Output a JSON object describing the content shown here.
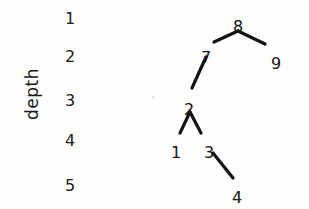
{
  "figure": {
    "background_color": "#fdfdfc",
    "ink_color": "#141414",
    "width": 309,
    "height": 209
  },
  "axis": {
    "label": "depth",
    "orientation": "vertical-rotated",
    "ticks": [
      {
        "text": "1",
        "x": 60,
        "y": 9
      },
      {
        "text": "2",
        "x": 60,
        "y": 47
      },
      {
        "text": "3",
        "x": 60,
        "y": 91
      },
      {
        "text": "4",
        "x": 60,
        "y": 131
      },
      {
        "text": "5",
        "x": 60,
        "y": 176
      }
    ]
  },
  "chart_data": {
    "type": "diagram",
    "title": "",
    "xlabel": "",
    "ylabel": "depth",
    "ylim": [
      1,
      5
    ],
    "grid": false,
    "legend": null,
    "nodes": [
      {
        "id": "8",
        "label": "8",
        "depth": 1,
        "x": 238,
        "y": 17
      },
      {
        "id": "7",
        "label": "7",
        "depth": 2,
        "x": 206,
        "y": 48
      },
      {
        "id": "9",
        "label": "9",
        "depth": 2,
        "x": 276,
        "y": 54
      },
      {
        "id": "2",
        "label": "2",
        "depth": 3,
        "x": 189,
        "y": 100
      },
      {
        "id": "1",
        "label": "1",
        "depth": 4,
        "x": 176,
        "y": 143
      },
      {
        "id": "3",
        "label": "3",
        "depth": 4,
        "x": 209,
        "y": 143
      },
      {
        "id": "4",
        "label": "4",
        "depth": 5,
        "x": 237,
        "y": 188
      }
    ],
    "edges": [
      {
        "from": "8",
        "to": "7",
        "x1": 238,
        "y1": 31,
        "x2": 214,
        "y2": 42
      },
      {
        "from": "8",
        "to": "9",
        "x1": 238,
        "y1": 31,
        "x2": 265,
        "y2": 44
      },
      {
        "from": "7",
        "to": "2",
        "x1": 206,
        "y1": 57,
        "x2": 192,
        "y2": 88
      },
      {
        "from": "2",
        "to": "1",
        "x1": 190,
        "y1": 112,
        "x2": 180,
        "y2": 133
      },
      {
        "from": "2",
        "to": "3",
        "x1": 190,
        "y1": 112,
        "x2": 201,
        "y2": 133
      },
      {
        "from": "3",
        "to": "4",
        "x1": 213,
        "y1": 153,
        "x2": 233,
        "y2": 178
      }
    ]
  },
  "artifacts": [
    {
      "name": "scan-speck",
      "x": 152,
      "y": 96,
      "size": 2
    }
  ]
}
